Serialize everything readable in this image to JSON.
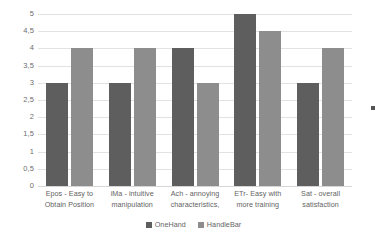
{
  "chart_data": {
    "type": "bar",
    "title": "",
    "subtitle": "",
    "xlabel": "",
    "ylabel": "",
    "ylim": [
      0,
      5
    ],
    "y_tick_step": 0.5,
    "grid": true,
    "legend_position": "bottom",
    "decimal_separator": ",",
    "categories": [
      "Epos - Easy to Obtain Position",
      "iMa - intuitive manipulation",
      "Ach - annoying characteristics,",
      "ETr- Easy with more training",
      "Sat - overall satisfaction"
    ],
    "category_lines": [
      [
        "Epos - Easy to",
        "Obtain Position"
      ],
      [
        "iMa - intuitive",
        "manipulation"
      ],
      [
        "Ach - annoying",
        "characteristics,"
      ],
      [
        "ETr- Easy with",
        "more training"
      ],
      [
        "Sat - overall",
        "satisfaction"
      ]
    ],
    "y_tick_labels": [
      "0",
      "0,5",
      "1",
      "1,5",
      "2",
      "2,5",
      "3",
      "3,5",
      "4",
      "4,5",
      "5"
    ],
    "y_tick_values": [
      0,
      0.5,
      1,
      1.5,
      2,
      2.5,
      3,
      3.5,
      4,
      4.5,
      5
    ],
    "series": [
      {
        "name": "OneHand",
        "color": "#5e5e5e",
        "values": [
          3,
          3,
          4,
          5,
          3
        ]
      },
      {
        "name": "HandleBar",
        "color": "#8d8d8d",
        "values": [
          4,
          4,
          3,
          4.5,
          4
        ]
      }
    ]
  },
  "colors": {
    "background": "#ffffff",
    "gridline": "#e2e2e2",
    "baseline": "#d6d6d6",
    "tick_text": "#6d6d6d",
    "label_text": "#636363",
    "series_one_hand": "#5e5e5e",
    "series_handle_bar": "#8d8d8d"
  },
  "artifacts": {
    "edge_mark": "scan-artifact-dot"
  }
}
